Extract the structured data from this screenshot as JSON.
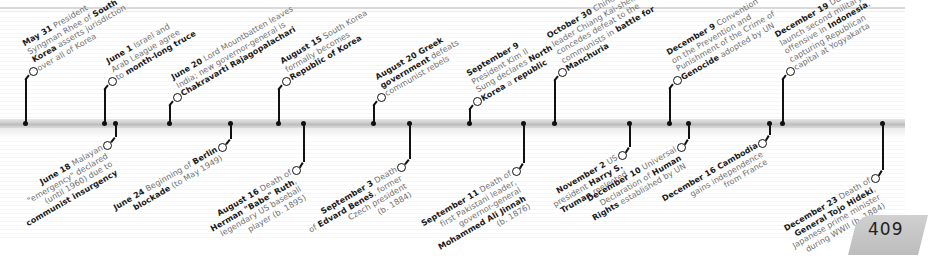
{
  "page": {
    "number": "409"
  },
  "timeline": {
    "top_events": [
      {
        "date": "May 31",
        "parts": [
          [
            "b",
            "May 31"
          ],
          [
            "t",
            " President"
          ],
          [
            "br"
          ],
          [
            "t",
            "Syngman Rhee of "
          ],
          [
            "b",
            "South"
          ],
          [
            "br"
          ],
          [
            "b",
            "Korea"
          ],
          [
            "t",
            " asserts jurisdiction"
          ],
          [
            "br"
          ],
          [
            "t",
            "over all of Korea"
          ]
        ]
      },
      {
        "date": "June 1",
        "parts": [
          [
            "b",
            "June 1"
          ],
          [
            "t",
            " Israel and"
          ],
          [
            "br"
          ],
          [
            "t",
            "Arab League agree"
          ],
          [
            "br"
          ],
          [
            "t",
            "to "
          ],
          [
            "b",
            "month-long truce"
          ]
        ]
      },
      {
        "date": "June 20",
        "parts": [
          [
            "b",
            "June 20"
          ],
          [
            "t",
            " Lord Mountbatten leaves"
          ],
          [
            "br"
          ],
          [
            "t",
            "India; new governor-general is"
          ],
          [
            "br"
          ],
          [
            "b",
            "Chakravarti Rajagopalachari"
          ]
        ]
      },
      {
        "date": "August 15",
        "parts": [
          [
            "b",
            "August 15"
          ],
          [
            "t",
            " South Korea"
          ],
          [
            "br"
          ],
          [
            "t",
            "formally becomes"
          ],
          [
            "br"
          ],
          [
            "b",
            "Republic of Korea"
          ]
        ]
      },
      {
        "date": "August 20",
        "parts": [
          [
            "b",
            "August 20 Greek"
          ],
          [
            "br"
          ],
          [
            "b",
            "government"
          ],
          [
            "t",
            " defeats"
          ],
          [
            "br"
          ],
          [
            "t",
            "communist rebels"
          ]
        ]
      },
      {
        "date": "September 9",
        "parts": [
          [
            "b",
            "September 9"
          ],
          [
            "br"
          ],
          [
            "t",
            "President Kim Il"
          ],
          [
            "br"
          ],
          [
            "t",
            "Sung declares "
          ],
          [
            "b",
            "North"
          ],
          [
            "br"
          ],
          [
            "b",
            "Korea"
          ],
          [
            "t",
            " a "
          ],
          [
            "b",
            "republic"
          ]
        ]
      },
      {
        "date": "October 30",
        "parts": [
          [
            "b",
            "October 30"
          ],
          [
            "t",
            " Chinese"
          ],
          [
            "br"
          ],
          [
            "t",
            "leader Chiang Kai-shek"
          ],
          [
            "br"
          ],
          [
            "t",
            "concedes defeat to the"
          ],
          [
            "br"
          ],
          [
            "t",
            "communists in "
          ],
          [
            "b",
            "battle for"
          ],
          [
            "br"
          ],
          [
            "b",
            "Manchuria"
          ]
        ]
      },
      {
        "date": "December 9",
        "parts": [
          [
            "b",
            "December 9"
          ],
          [
            "t",
            " Convention"
          ],
          [
            "br"
          ],
          [
            "t",
            "on the Prevention and"
          ],
          [
            "br"
          ],
          [
            "t",
            "Punishment of the Crime of"
          ],
          [
            "br"
          ],
          [
            "b",
            "Genocide"
          ],
          [
            "t",
            " adopted by UN"
          ]
        ]
      },
      {
        "date": "December 19",
        "parts": [
          [
            "b",
            "December 19"
          ],
          [
            "t",
            " Dutch"
          ],
          [
            "br"
          ],
          [
            "t",
            "launch second military"
          ],
          [
            "br"
          ],
          [
            "t",
            "offensive in "
          ],
          [
            "b",
            "Indonesia"
          ],
          [
            "t",
            ","
          ],
          [
            "br"
          ],
          [
            "t",
            "capturing Republican"
          ],
          [
            "br"
          ],
          [
            "t",
            "capital at Yogyakarta"
          ]
        ]
      }
    ],
    "bottom_events": [
      {
        "date": "June 18",
        "parts": [
          [
            "b",
            "June 18"
          ],
          [
            "t",
            " Malayan"
          ],
          [
            "br"
          ],
          [
            "t",
            "\"emergency\" declared"
          ],
          [
            "br"
          ],
          [
            "t",
            "(until 1960) due to"
          ],
          [
            "br"
          ],
          [
            "b",
            "communist insurgency"
          ]
        ]
      },
      {
        "date": "June 24",
        "parts": [
          [
            "b",
            "June 24"
          ],
          [
            "t",
            " Beginning of "
          ],
          [
            "b",
            "Berlin"
          ],
          [
            "br"
          ],
          [
            "b",
            "blockade"
          ],
          [
            "t",
            " (to May 1949)"
          ]
        ]
      },
      {
        "date": "August 16",
        "parts": [
          [
            "b",
            "August 16"
          ],
          [
            "t",
            " Death of"
          ],
          [
            "br"
          ],
          [
            "b",
            "Herman \"Babe\" Ruth"
          ],
          [
            "t",
            ","
          ],
          [
            "br"
          ],
          [
            "t",
            "legendary US baseball"
          ],
          [
            "br"
          ],
          [
            "t",
            "player (b. 1895)"
          ]
        ]
      },
      {
        "date": "September 3",
        "parts": [
          [
            "b",
            "September 3"
          ],
          [
            "t",
            " Death"
          ],
          [
            "br"
          ],
          [
            "t",
            "of "
          ],
          [
            "b",
            "Edvard Beneš"
          ],
          [
            "t",
            ", former"
          ],
          [
            "br"
          ],
          [
            "t",
            "Czech president"
          ],
          [
            "br"
          ],
          [
            "t",
            "(b. 1884)"
          ]
        ]
      },
      {
        "date": "September 11",
        "parts": [
          [
            "b",
            "September 11"
          ],
          [
            "t",
            " Death of"
          ],
          [
            "br"
          ],
          [
            "t",
            "first Pakistani leader,"
          ],
          [
            "br"
          ],
          [
            "t",
            "governor-general"
          ],
          [
            "br"
          ],
          [
            "b",
            "Mohammed Ali Jinnah"
          ],
          [
            "br"
          ],
          [
            "t",
            "(b. 1876)"
          ]
        ]
      },
      {
        "date": "November 2",
        "parts": [
          [
            "b",
            "November 2"
          ],
          [
            "t",
            " US"
          ],
          [
            "br"
          ],
          [
            "t",
            "president "
          ],
          [
            "b",
            "Harry S."
          ],
          [
            "br"
          ],
          [
            "b",
            "Truman"
          ],
          [
            "t",
            " reelected"
          ]
        ]
      },
      {
        "date": "December 10",
        "parts": [
          [
            "b",
            "December 10"
          ],
          [
            "t",
            " Universal"
          ],
          [
            "br"
          ],
          [
            "t",
            "Declaration of "
          ],
          [
            "b",
            "Human"
          ],
          [
            "br"
          ],
          [
            "b",
            "Rights"
          ],
          [
            "t",
            " established by UN"
          ]
        ]
      },
      {
        "date": "December 16",
        "parts": [
          [
            "b",
            "December 16 Cambodia"
          ],
          [
            "br"
          ],
          [
            "t",
            "gains independence"
          ],
          [
            "br"
          ],
          [
            "t",
            "from France"
          ]
        ]
      },
      {
        "date": "December 23",
        "parts": [
          [
            "b",
            "December 23"
          ],
          [
            "t",
            " Death of"
          ],
          [
            "br"
          ],
          [
            "b",
            "General Tojo Hideki"
          ],
          [
            "t",
            ","
          ],
          [
            "br"
          ],
          [
            "t",
            "Japanese prime minister"
          ],
          [
            "br"
          ],
          [
            "t",
            "during WWII (b. 1884)"
          ]
        ]
      }
    ]
  }
}
